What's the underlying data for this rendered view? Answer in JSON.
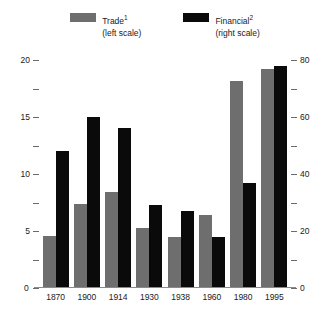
{
  "chart_data": {
    "type": "bar",
    "title": "",
    "xlabel": "",
    "grid": false,
    "legend_position": "top-center",
    "categories": [
      "1870",
      "1900",
      "1914",
      "1930",
      "1938",
      "1960",
      "1980",
      "1995"
    ],
    "series": [
      {
        "name": "Trade",
        "footnote": "1",
        "scale": "left",
        "scale_label": "(left scale)",
        "color": "#6e6e6e",
        "values": [
          4.6,
          7.4,
          8.4,
          5.3,
          4.5,
          6.4,
          18.2,
          19.2
        ]
      },
      {
        "name": "Financial",
        "footnote": "2",
        "scale": "right",
        "scale_label": "(right scale)",
        "color": "#0a0a0a",
        "values": [
          48,
          60,
          56,
          29,
          27,
          18,
          37,
          78
        ]
      }
    ],
    "left_axis": {
      "label": "",
      "ylim": [
        0,
        20
      ],
      "ticks": [
        0,
        5,
        10,
        15,
        20
      ],
      "tick_labels": [
        "0",
        "5",
        "10",
        "15",
        "20"
      ],
      "minor_ticks": [
        2.5,
        7.5,
        12.5,
        17.5
      ]
    },
    "right_axis": {
      "label": "",
      "ylim": [
        0,
        80
      ],
      "ticks": [
        0,
        20,
        40,
        60,
        80
      ],
      "tick_labels": [
        "0",
        "20",
        "40",
        "60",
        "80"
      ],
      "minor_ticks": [
        10,
        30,
        50,
        70
      ]
    }
  }
}
